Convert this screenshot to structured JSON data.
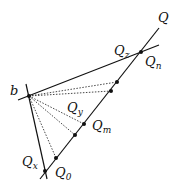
{
  "diagram": {
    "labels": {
      "Q": "Q",
      "b": "b",
      "Qz": {
        "base": "Q",
        "sub": "z"
      },
      "Qn": {
        "base": "Q",
        "sub": "n"
      },
      "Qy": {
        "base": "Q",
        "sub": "y"
      },
      "Qm": {
        "base": "Q",
        "sub": "m"
      },
      "Qx": {
        "base": "Q",
        "sub": "x"
      },
      "Q0": {
        "base": "Q",
        "sub": "0"
      }
    },
    "colors": {
      "line": "#111111",
      "dotted": "#333333"
    }
  }
}
